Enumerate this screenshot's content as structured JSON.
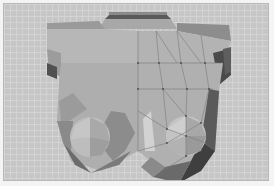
{
  "viewport": {
    "label": "3d-viewport",
    "background": "#c6c6c6",
    "grid_line": "#d7d7d7",
    "grid_spacing_px": 6,
    "frame": "#f4f4f4"
  },
  "model": {
    "name": "low-poly-torso-mesh",
    "shading": {
      "left_half": "flat-shaded",
      "right_half": "flat-shaded-with-wireframe"
    },
    "colors": {
      "light": "#b9b9b9",
      "mid": "#a6a6a6",
      "midDark": "#8f8f8f",
      "dark": "#6e6e6e",
      "darkest": "#3f3f3f",
      "highlight": "#cfcfcf",
      "wire": "#7a7a7a",
      "vertex": "#4a4a4a"
    }
  }
}
